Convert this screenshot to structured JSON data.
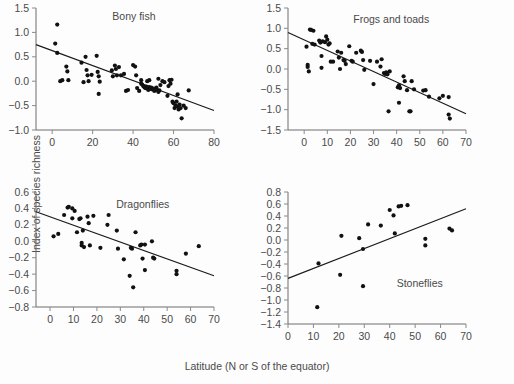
{
  "figure": {
    "xlabel": "Latitude (N or S of the equator)",
    "ylabel": "Index of species richness"
  },
  "chart_data": [
    {
      "type": "scatter",
      "title": "Bony fish",
      "xlabel": "Latitude (N or S of the equator)",
      "ylabel": "Index of species richness",
      "xlim": [
        -8,
        80
      ],
      "ylim": [
        -1.0,
        1.5
      ],
      "xticks": [
        0,
        20,
        40,
        60,
        80
      ],
      "yticks": [
        -1.0,
        -0.5,
        0.0,
        0.5,
        1.0,
        1.5
      ],
      "grid": false,
      "legend": "none",
      "trendline": {
        "x": [
          -8,
          80
        ],
        "y": [
          0.75,
          -0.6
        ]
      },
      "points": [
        [
          2.5,
          1.16
        ],
        [
          1.5,
          0.77
        ],
        [
          2.5,
          0.58
        ],
        [
          4.0,
          0.0
        ],
        [
          5.0,
          0.02
        ],
        [
          7.0,
          0.3
        ],
        [
          7.5,
          0.2
        ],
        [
          8.0,
          0.02
        ],
        [
          14.5,
          0.38
        ],
        [
          15.5,
          -0.02
        ],
        [
          16.5,
          0.5
        ],
        [
          17.0,
          0.23
        ],
        [
          17.5,
          0.12
        ],
        [
          18.0,
          0.0
        ],
        [
          19.5,
          0.13
        ],
        [
          22.0,
          0.52
        ],
        [
          22.5,
          0.19
        ],
        [
          23.0,
          0.1
        ],
        [
          23.5,
          -0.01
        ],
        [
          23.0,
          -0.26
        ],
        [
          29.5,
          0.22
        ],
        [
          30.0,
          0.1
        ],
        [
          31.0,
          0.32
        ],
        [
          31.5,
          0.25
        ],
        [
          32.0,
          0.12
        ],
        [
          33.0,
          0.29
        ],
        [
          34.0,
          0.12
        ],
        [
          35.5,
          0.15
        ],
        [
          36.5,
          -0.2
        ],
        [
          37.5,
          -0.18
        ],
        [
          40.0,
          0.33
        ],
        [
          41.0,
          0.3
        ],
        [
          41.5,
          0.12
        ],
        [
          42.0,
          -0.14
        ],
        [
          43.0,
          -0.2
        ],
        [
          44.0,
          -0.05
        ],
        [
          44.5,
          -0.07
        ],
        [
          45.0,
          -0.1
        ],
        [
          45.5,
          -0.12
        ],
        [
          46.0,
          -0.14
        ],
        [
          46.5,
          -0.11
        ],
        [
          47.0,
          -0.15
        ],
        [
          47.5,
          -0.18
        ],
        [
          48.0,
          -0.12
        ],
        [
          48.5,
          -0.16
        ],
        [
          49.0,
          -0.13
        ],
        [
          49.5,
          -0.17
        ],
        [
          50.0,
          -0.15
        ],
        [
          50.5,
          -0.2
        ],
        [
          51.0,
          -0.17
        ],
        [
          51.5,
          -0.13
        ],
        [
          52.0,
          -0.18
        ],
        [
          52.5,
          -0.22
        ],
        [
          53.0,
          -0.19
        ],
        [
          44.0,
          0.02
        ],
        [
          47.0,
          0.0
        ],
        [
          48.0,
          0.02
        ],
        [
          52.5,
          0.05
        ],
        [
          53.5,
          -0.08
        ],
        [
          54.5,
          0.0
        ],
        [
          55.5,
          -0.02
        ],
        [
          57.0,
          -0.3
        ],
        [
          58.0,
          0.02
        ],
        [
          58.5,
          -0.05
        ],
        [
          59.0,
          0.03
        ],
        [
          59.5,
          -0.42
        ],
        [
          60.0,
          -0.45
        ],
        [
          60.5,
          -0.55
        ],
        [
          61.0,
          -0.5
        ],
        [
          61.5,
          -0.42
        ],
        [
          62.0,
          -0.52
        ],
        [
          62.5,
          -0.58
        ],
        [
          63.0,
          -0.48
        ],
        [
          63.5,
          -0.55
        ],
        [
          64.0,
          -0.76
        ],
        [
          65.0,
          -0.5
        ],
        [
          66.0,
          -0.55
        ],
        [
          67.5,
          -0.19
        ],
        [
          62.0,
          -0.27
        ],
        [
          57.5,
          -0.1
        ]
      ]
    },
    {
      "type": "scatter",
      "title": "Frogs and toads",
      "xlabel": "Latitude (N or S of the equator)",
      "ylabel": "Index of species richness",
      "xlim": [
        -7,
        70
      ],
      "ylim": [
        -1.5,
        1.5
      ],
      "xticks": [
        0,
        10,
        20,
        30,
        40,
        50,
        60,
        70
      ],
      "yticks": [
        -1.5,
        -1.0,
        -0.5,
        0.0,
        0.5,
        1.0,
        1.5
      ],
      "grid": false,
      "legend": "none",
      "trendline": {
        "x": [
          -7,
          70
        ],
        "y": [
          0.9,
          -1.1
        ]
      },
      "points": [
        [
          1.0,
          0.55
        ],
        [
          1.5,
          0.1
        ],
        [
          1.5,
          0.05
        ],
        [
          2.0,
          -0.06
        ],
        [
          2.5,
          0.97
        ],
        [
          3.0,
          0.96
        ],
        [
          3.5,
          0.62
        ],
        [
          4.0,
          0.94
        ],
        [
          4.5,
          0.6
        ],
        [
          6.5,
          0.7
        ],
        [
          7.0,
          0.65
        ],
        [
          7.5,
          0.32
        ],
        [
          7.5,
          0.03
        ],
        [
          8.0,
          0.68
        ],
        [
          9.0,
          0.66
        ],
        [
          9.5,
          0.8
        ],
        [
          10.0,
          0.72
        ],
        [
          10.5,
          0.6
        ],
        [
          11.0,
          0.63
        ],
        [
          11.5,
          0.18
        ],
        [
          12.5,
          0.18
        ],
        [
          14.5,
          0.43
        ],
        [
          15.0,
          0.28
        ],
        [
          15.5,
          0.0
        ],
        [
          16.0,
          0.4
        ],
        [
          17.0,
          0.22
        ],
        [
          17.5,
          0.2
        ],
        [
          18.0,
          0.12
        ],
        [
          19.5,
          0.56
        ],
        [
          20.5,
          0.2
        ],
        [
          21.0,
          0.18
        ],
        [
          24.5,
          0.45
        ],
        [
          25.0,
          0.42
        ],
        [
          25.5,
          0.22
        ],
        [
          28.5,
          0.2
        ],
        [
          30.0,
          -0.37
        ],
        [
          31.5,
          0.18
        ],
        [
          33.0,
          0.06
        ],
        [
          33.5,
          0.24
        ],
        [
          34.5,
          -0.1
        ],
        [
          35.0,
          -0.12
        ],
        [
          35.5,
          -0.08
        ],
        [
          36.0,
          -0.13
        ],
        [
          36.5,
          -1.04
        ],
        [
          37.0,
          -0.06
        ],
        [
          40.5,
          -0.45
        ],
        [
          41.0,
          -0.4
        ],
        [
          41.5,
          -0.47
        ],
        [
          41.0,
          -0.83
        ],
        [
          43.0,
          -0.18
        ],
        [
          43.5,
          -0.3
        ],
        [
          44.5,
          -0.52
        ],
        [
          45.5,
          -1.04
        ],
        [
          46.0,
          -1.04
        ],
        [
          46.5,
          -0.3
        ],
        [
          47.5,
          -0.5
        ],
        [
          51.5,
          -0.53
        ],
        [
          52.5,
          -0.52
        ],
        [
          54.0,
          -0.68
        ],
        [
          58.5,
          -0.72
        ],
        [
          60.0,
          -0.66
        ],
        [
          62.5,
          -0.69
        ],
        [
          62.5,
          -1.12
        ],
        [
          63.0,
          -1.22
        ],
        [
          22.5,
          0.4
        ],
        [
          26.0,
          -0.02
        ]
      ]
    },
    {
      "type": "scatter",
      "title": "Dragonflies",
      "xlabel": "Latitude (N or S of the equator)",
      "ylabel": "Index of species richness",
      "xlim": [
        -6,
        70
      ],
      "ylim": [
        -0.8,
        0.6
      ],
      "xticks": [
        0,
        10,
        20,
        30,
        40,
        50,
        60,
        70
      ],
      "yticks": [
        -0.8,
        -0.6,
        -0.4,
        -0.2,
        0.0,
        0.2,
        0.4,
        0.6
      ],
      "grid": false,
      "legend": "none",
      "trendline": {
        "x": [
          -6,
          70
        ],
        "y": [
          0.36,
          -0.42
        ]
      },
      "points": [
        [
          1.5,
          0.06
        ],
        [
          3.5,
          0.09
        ],
        [
          6.0,
          0.32
        ],
        [
          7.5,
          0.41
        ],
        [
          8.0,
          0.42
        ],
        [
          9.5,
          0.4
        ],
        [
          9.5,
          0.28
        ],
        [
          10.5,
          0.37
        ],
        [
          11.5,
          0.11
        ],
        [
          12.5,
          0.27
        ],
        [
          13.0,
          0.28
        ],
        [
          13.5,
          -0.02
        ],
        [
          13.5,
          -0.05
        ],
        [
          14.0,
          0.13
        ],
        [
          14.5,
          -0.07
        ],
        [
          16.0,
          0.3
        ],
        [
          16.5,
          0.22
        ],
        [
          17.0,
          -0.05
        ],
        [
          18.5,
          0.31
        ],
        [
          21.5,
          -0.08
        ],
        [
          24.5,
          0.2
        ],
        [
          25.0,
          0.32
        ],
        [
          28.5,
          0.13
        ],
        [
          29.0,
          -0.09
        ],
        [
          31.5,
          -0.22
        ],
        [
          34.0,
          -0.42
        ],
        [
          34.5,
          -0.08
        ],
        [
          35.0,
          -0.09
        ],
        [
          35.5,
          -0.56
        ],
        [
          36.5,
          0.11
        ],
        [
          38.5,
          -0.05
        ],
        [
          39.0,
          -0.04
        ],
        [
          39.5,
          -0.21
        ],
        [
          40.5,
          -0.04
        ],
        [
          40.5,
          -0.35
        ],
        [
          43.5,
          0.0
        ],
        [
          44.0,
          -0.2
        ],
        [
          44.5,
          -0.21
        ],
        [
          54.0,
          -0.36
        ],
        [
          54.0,
          -0.4
        ],
        [
          58.0,
          -0.15
        ],
        [
          63.5,
          -0.06
        ]
      ]
    },
    {
      "type": "scatter",
      "title": "Stoneflies",
      "xlabel": "Latitude (N or S of the equator)",
      "ylabel": "Index of species richness",
      "xlim": [
        0,
        70
      ],
      "ylim": [
        -1.4,
        0.8
      ],
      "xticks": [
        0,
        10,
        20,
        30,
        40,
        50,
        60,
        70
      ],
      "yticks": [
        -1.4,
        -1.2,
        -1.0,
        -0.8,
        -0.6,
        -0.4,
        -0.2,
        0.0,
        0.2,
        0.4,
        0.6,
        0.8
      ],
      "grid": false,
      "legend": "none",
      "trendline": {
        "x": [
          0,
          70
        ],
        "y": [
          -0.64,
          0.52
        ]
      },
      "points": [
        [
          11.5,
          -1.12
        ],
        [
          12.0,
          -0.39
        ],
        [
          20.5,
          -0.58
        ],
        [
          21.0,
          0.07
        ],
        [
          28.0,
          0.03
        ],
        [
          29.5,
          -0.15
        ],
        [
          29.5,
          -0.77
        ],
        [
          31.5,
          0.26
        ],
        [
          36.5,
          0.24
        ],
        [
          40.0,
          0.5
        ],
        [
          41.5,
          0.41
        ],
        [
          42.0,
          0.11
        ],
        [
          43.5,
          0.56
        ],
        [
          44.5,
          0.57
        ],
        [
          47.0,
          0.58
        ],
        [
          54.0,
          0.02
        ],
        [
          54.0,
          -0.09
        ],
        [
          63.5,
          0.19
        ],
        [
          64.5,
          0.16
        ]
      ]
    }
  ]
}
